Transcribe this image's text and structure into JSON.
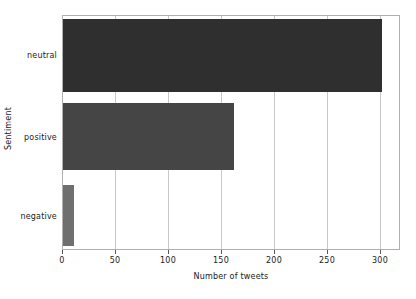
{
  "chart_data": {
    "type": "bar",
    "orientation": "horizontal",
    "title": "",
    "xlabel": "Number of tweets",
    "ylabel": "Sentiment",
    "categories": [
      "neutral",
      "positive",
      "negative"
    ],
    "values": [
      304,
      163,
      10
    ],
    "xlim": [
      0,
      320
    ],
    "xticks": [
      0,
      50,
      100,
      150,
      200,
      250,
      300
    ],
    "xtick_labels": [
      "0",
      "50",
      "100",
      "150",
      "200",
      "250",
      "300"
    ],
    "grid": true,
    "grid_axis": "x",
    "legend": false,
    "bar_colors": [
      "#2f2f2f",
      "#454545",
      "#6f6f6f"
    ],
    "grid_color": "#c8c8c8",
    "axes_color": "#b0b0b0",
    "background": "#ffffff",
    "series": [
      {
        "name": "Number of tweets",
        "points": [
          {
            "category": "neutral",
            "value": 304
          },
          {
            "category": "positive",
            "value": 163
          },
          {
            "category": "negative",
            "value": 10
          }
        ]
      }
    ]
  }
}
